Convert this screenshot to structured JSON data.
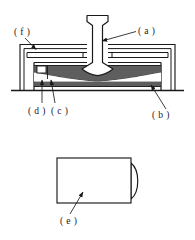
{
  "figure": {
    "type": "technical-line-drawing",
    "background_color": "#ffffff",
    "line_color": "#1a1a1a",
    "shade_color": "#5e5e5e",
    "views": [
      {
        "name": "upper-cross-section-view",
        "description": "Cross-sectional elevation of a device having an outer housing frame, an internal chamber, a bowed diaphragm element, and a central T-headed shaft rising from the diaphragm."
      },
      {
        "name": "lower-plan-view",
        "description": "Plan view of a rectangular plate with a convex lens-shaped protrusion on its right edge."
      }
    ],
    "labels": [
      {
        "id": "label-a",
        "text": "( a )",
        "x": 140,
        "y": 30,
        "target": "central-shaft"
      },
      {
        "id": "label-f",
        "text": "( f )",
        "x": 18,
        "y": 36,
        "target": "outer-frame"
      },
      {
        "id": "label-d",
        "text": "( d )",
        "x": 30,
        "y": 116,
        "target": "left-insert-block"
      },
      {
        "id": "label-c",
        "text": "( c )",
        "x": 55,
        "y": 116,
        "target": "diaphragm-edge"
      },
      {
        "id": "label-b",
        "text": "( b )",
        "x": 152,
        "y": 118,
        "target": "base-chamber"
      },
      {
        "id": "label-e",
        "text": "( e )",
        "x": 62,
        "y": 222,
        "target": "rectangular-plate"
      }
    ]
  }
}
